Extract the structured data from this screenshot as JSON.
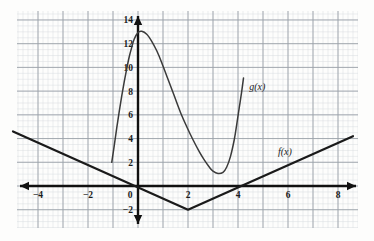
{
  "chart_data": {
    "type": "line",
    "title": "",
    "xlabel": "",
    "ylabel": "",
    "grid": true,
    "grid_minor": true,
    "legend": "inline-curve-labels",
    "xlim": [
      -5.0,
      8.8
    ],
    "ylim": [
      -3.0,
      15.0
    ],
    "xticks": [
      -4,
      -2,
      0,
      2,
      4,
      6,
      8
    ],
    "xtick_labels": [
      "-4",
      "-2",
      "0",
      "2",
      "4",
      "6",
      "8"
    ],
    "yticks": [
      -2,
      2,
      4,
      6,
      8,
      10,
      12,
      14
    ],
    "ytick_labels": [
      "-2",
      "2",
      "4",
      "6",
      "8",
      "10",
      "12",
      "14"
    ],
    "axis_arrows": [
      "left",
      "right",
      "up",
      "down"
    ],
    "series": [
      {
        "name": "f(x)",
        "label": "f(x)",
        "type": "piecewise-linear",
        "color": "#1a1a1a",
        "linewidth": 2.2,
        "description": "V-shaped absolute value graph with vertex at (2,-2)",
        "points": [
          [
            -5.0,
            4.6
          ],
          [
            2.0,
            -2.0
          ],
          [
            8.6,
            4.2
          ]
        ],
        "label_position": [
          5.6,
          2.6
        ]
      },
      {
        "name": "g(x)",
        "label": "g(x)",
        "type": "cubic-curve",
        "color": "#3a3a3a",
        "linewidth": 1.5,
        "description": "Cubic-like curve rising to local max near (-0.1,13), falling to local min near (3,1), then rising steeply",
        "points": [
          [
            -1.05,
            2.0
          ],
          [
            -0.95,
            3.4
          ],
          [
            -0.85,
            4.9
          ],
          [
            -0.75,
            6.3
          ],
          [
            -0.65,
            7.6
          ],
          [
            -0.55,
            8.8
          ],
          [
            -0.45,
            9.9
          ],
          [
            -0.35,
            10.9
          ],
          [
            -0.25,
            11.7
          ],
          [
            -0.15,
            12.4
          ],
          [
            0.0,
            12.95
          ],
          [
            0.15,
            13.05
          ],
          [
            0.35,
            12.8
          ],
          [
            0.55,
            12.2
          ],
          [
            0.75,
            11.4
          ],
          [
            0.95,
            10.4
          ],
          [
            1.2,
            9.0
          ],
          [
            1.45,
            7.6
          ],
          [
            1.7,
            6.2
          ],
          [
            1.95,
            5.0
          ],
          [
            2.2,
            3.9
          ],
          [
            2.45,
            2.9
          ],
          [
            2.65,
            2.2
          ],
          [
            2.85,
            1.6
          ],
          [
            3.0,
            1.25
          ],
          [
            3.2,
            1.05
          ],
          [
            3.4,
            1.15
          ],
          [
            3.55,
            1.6
          ],
          [
            3.7,
            2.5
          ],
          [
            3.85,
            3.9
          ],
          [
            3.95,
            5.2
          ],
          [
            4.05,
            6.6
          ],
          [
            4.15,
            8.0
          ],
          [
            4.22,
            9.1
          ]
        ],
        "label_position": [
          4.45,
          8.1
        ]
      }
    ],
    "annotations": [
      {
        "text": "f(x)",
        "x": 5.6,
        "y": 2.6
      },
      {
        "text": "g(x)",
        "x": 4.45,
        "y": 8.1
      }
    ],
    "colors": {
      "axis": "#111111",
      "grid_major": "#9aa0a8",
      "grid_minor": "#d8dce0",
      "curve_f": "#1a1a1a",
      "curve_g": "#3a3a3a",
      "background": "#fdfdfc"
    }
  }
}
